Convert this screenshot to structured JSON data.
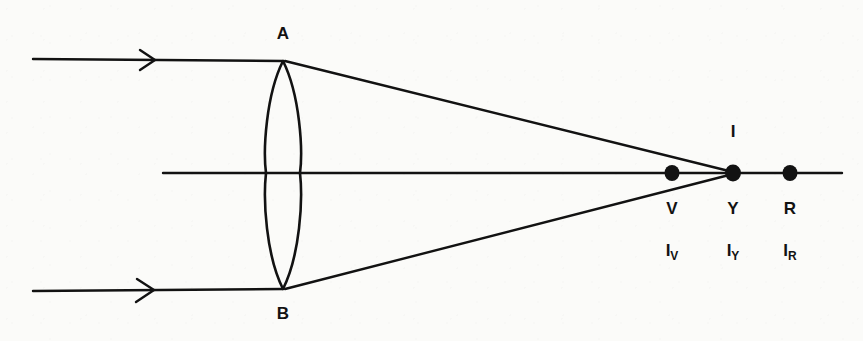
{
  "diagram": {
    "ink_color": "#121212",
    "paper_color": "#fbfbf9",
    "lens": {
      "top_vertex_label": "A",
      "bottom_vertex_label": "B",
      "type": "biconvex-converging-lens"
    },
    "axis": {
      "name": "principal-optical-axis"
    },
    "rays": [
      {
        "name": "upper-incident-ray",
        "direction_marker": "arrowhead-right"
      },
      {
        "name": "lower-incident-ray",
        "direction_marker": "arrowhead-right"
      },
      {
        "name": "upper-refracted-ray",
        "direction_marker": "none"
      },
      {
        "name": "lower-refracted-ray",
        "direction_marker": "none"
      }
    ],
    "focus_marker_label": "I",
    "focal_points": [
      {
        "point_label": "V",
        "image_label": "I",
        "image_subscript": "V",
        "color_name": "violet"
      },
      {
        "point_label": "Y",
        "image_label": "I",
        "image_subscript": "Y",
        "color_name": "yellow"
      },
      {
        "point_label": "R",
        "image_label": "I",
        "image_subscript": "R",
        "color_name": "red"
      }
    ]
  }
}
